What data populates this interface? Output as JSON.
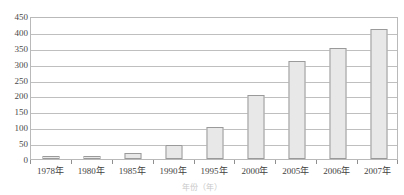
{
  "chart_data": {
    "type": "bar",
    "title": "",
    "subtitle": "",
    "xlabel": "年份（年）",
    "ylabel": "",
    "categories": [
      "1978年",
      "1980年",
      "1985年",
      "1990年",
      "1995年",
      "2000年",
      "2005年",
      "2006年",
      "2007年"
    ],
    "values": [
      8,
      10,
      20,
      45,
      100,
      200,
      310,
      350,
      410
    ],
    "ylim": [
      0,
      450
    ],
    "ytick_labels": [
      "450",
      "400",
      "350",
      "300",
      "250",
      "200",
      "150",
      "100",
      "50",
      "0"
    ],
    "ytick_values": [
      450,
      400,
      350,
      300,
      250,
      200,
      150,
      100,
      50,
      0
    ],
    "ytick_step": 50,
    "grid": true,
    "legend": false,
    "legend_position": "none",
    "series": [
      {
        "name": "",
        "values": [
          8,
          10,
          20,
          45,
          100,
          200,
          310,
          350,
          410
        ]
      }
    ]
  },
  "style": {
    "bar_fill": "#e8e8e8",
    "bar_stroke": "#9a9a9a",
    "gridline_color": "#bfbfbf",
    "frame_color": "#b9b9b9",
    "background": "#ffffff",
    "tick_label_color": "#3f3f3f"
  }
}
